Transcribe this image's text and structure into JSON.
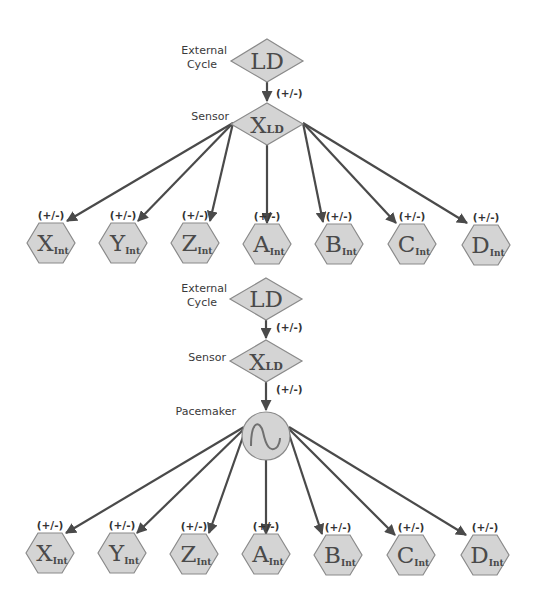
{
  "colors": {
    "node_fill": "#d4d4d4",
    "node_stroke": "#8a8a8a",
    "edge": "#4a4a4a",
    "text": "#4a4a4a"
  },
  "diagram_top": {
    "external_cycle": {
      "label_line1": "External",
      "label_line2": "Cycle",
      "node": "LD",
      "shape": "diamond"
    },
    "edge_ld_to_sensor": {
      "sign": "(+/-)"
    },
    "sensor": {
      "label": "Sensor",
      "node_main": "X",
      "node_sub": "LD",
      "shape": "diamond"
    },
    "outputs": [
      {
        "main": "X",
        "sub": "Int",
        "sign": "(+/-)"
      },
      {
        "main": "Y",
        "sub": "Int",
        "sign": "(+/-)"
      },
      {
        "main": "Z",
        "sub": "Int",
        "sign": "(+/-)"
      },
      {
        "main": "A",
        "sub": "Int",
        "sign": "(+/-)"
      },
      {
        "main": "B",
        "sub": "Int",
        "sign": "(+/-)"
      },
      {
        "main": "C",
        "sub": "Int",
        "sign": "(+/-)"
      },
      {
        "main": "D",
        "sub": "Int",
        "sign": "(+/-)"
      }
    ]
  },
  "diagram_bottom": {
    "external_cycle": {
      "label_line1": "External",
      "label_line2": "Cycle",
      "node": "LD",
      "shape": "diamond"
    },
    "edge_ld_to_sensor": {
      "sign": "(+/-)"
    },
    "sensor": {
      "label": "Sensor",
      "node_main": "X",
      "node_sub": "LD",
      "shape": "diamond"
    },
    "edge_sensor_to_pacemaker": {
      "sign": "(+/-)"
    },
    "pacemaker": {
      "label": "Pacemaker",
      "icon": "sine-wave-icon",
      "shape": "circle"
    },
    "outputs": [
      {
        "main": "X",
        "sub": "Int",
        "sign": "(+/-)"
      },
      {
        "main": "Y",
        "sub": "Int",
        "sign": "(+/-)"
      },
      {
        "main": "Z",
        "sub": "Int",
        "sign": "(+/-)"
      },
      {
        "main": "A",
        "sub": "Int",
        "sign": "(+/-)"
      },
      {
        "main": "B",
        "sub": "Int",
        "sign": "(+/-)"
      },
      {
        "main": "C",
        "sub": "Int",
        "sign": "(+/-)"
      },
      {
        "main": "D",
        "sub": "Int",
        "sign": "(+/-)"
      }
    ]
  }
}
